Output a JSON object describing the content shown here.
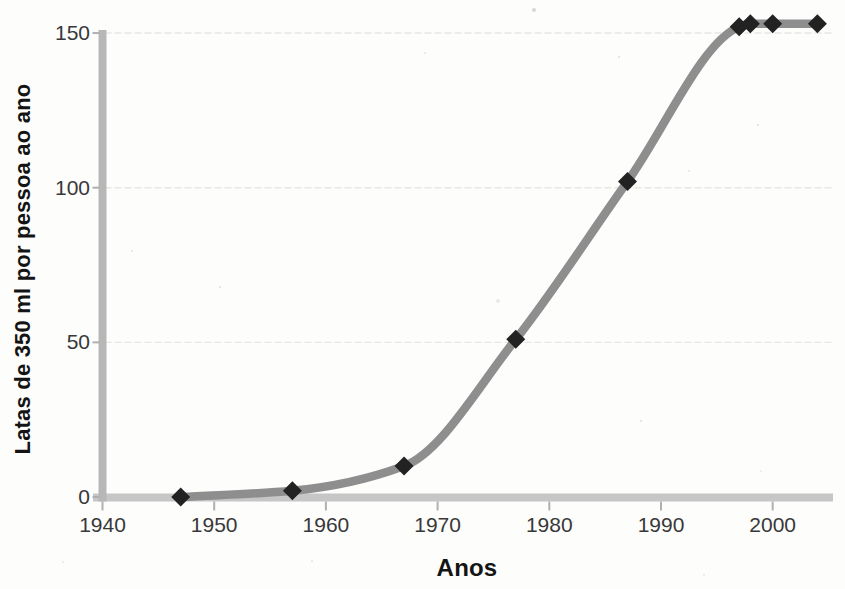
{
  "chart_data": {
    "type": "line",
    "title": "",
    "xlabel": "Anos",
    "ylabel": "Latas de 350 ml por pessoa ao ano",
    "x_ticks": [
      1940,
      1950,
      1960,
      1970,
      1980,
      1990,
      2000
    ],
    "y_ticks": [
      0,
      50,
      100,
      150
    ],
    "xlim": [
      1940,
      2005.4
    ],
    "ylim": [
      0,
      150
    ],
    "grid": "horizontal gridlines at 50, 100, 150 (very faint)",
    "legend": "none",
    "series": [
      {
        "name": "latas-por-pessoa",
        "marker": "diamond",
        "points": [
          {
            "x": 1947,
            "y": 0
          },
          {
            "x": 1957,
            "y": 2
          },
          {
            "x": 1967,
            "y": 10
          },
          {
            "x": 1977,
            "y": 51
          },
          {
            "x": 1987,
            "y": 102
          },
          {
            "x": 1997,
            "y": 152
          },
          {
            "x": 1998,
            "y": 153
          },
          {
            "x": 2000,
            "y": 153
          },
          {
            "x": 2004,
            "y": 153
          }
        ]
      }
    ],
    "colors": {
      "line": "#8e8e8e",
      "marker": "#222222",
      "y_axis": "#b7b7b7",
      "x_axis": "#c6c6c6",
      "grid": "#e8e5e0",
      "tick": "#b0b0b0",
      "tick_text": "#383838",
      "title_text": "#141414"
    }
  }
}
